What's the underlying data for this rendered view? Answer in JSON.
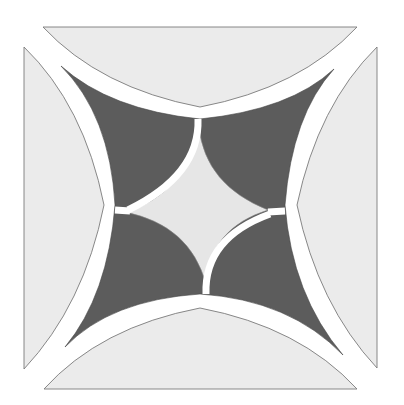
{
  "figure": {
    "colors": {
      "background": "#ffffff",
      "light_piece": "#ebebeb",
      "light_outline": "#7a7a7a",
      "dark_piece": "#5c5c5c",
      "center_piece": "#e6e6e6",
      "separator": "#ffffff"
    },
    "outer_pieces": [
      {
        "name": "top",
        "corners": [
          [
            43,
            27
          ],
          [
            357,
            27
          ]
        ],
        "arc_apex": [
          200,
          107
        ]
      },
      {
        "name": "right",
        "corners": [
          [
            377,
            47
          ],
          [
            377,
            368
          ]
        ],
        "arc_apex": [
          297,
          205
        ]
      },
      {
        "name": "bottom",
        "corners": [
          [
            44,
            389
          ],
          [
            357,
            389
          ]
        ],
        "arc_apex": [
          200,
          308
        ]
      },
      {
        "name": "left",
        "corners": [
          [
            24,
            47
          ],
          [
            24,
            369
          ]
        ],
        "arc_apex": [
          104,
          205
        ]
      }
    ],
    "dark_star_tips": [
      [
        61,
        66
      ],
      [
        334,
        69
      ],
      [
        343,
        355
      ],
      [
        65,
        347
      ]
    ],
    "center_diamond_points": [
      [
        199,
        127
      ],
      [
        268,
        210
      ],
      [
        206,
        284
      ],
      [
        125,
        212
      ]
    ]
  }
}
